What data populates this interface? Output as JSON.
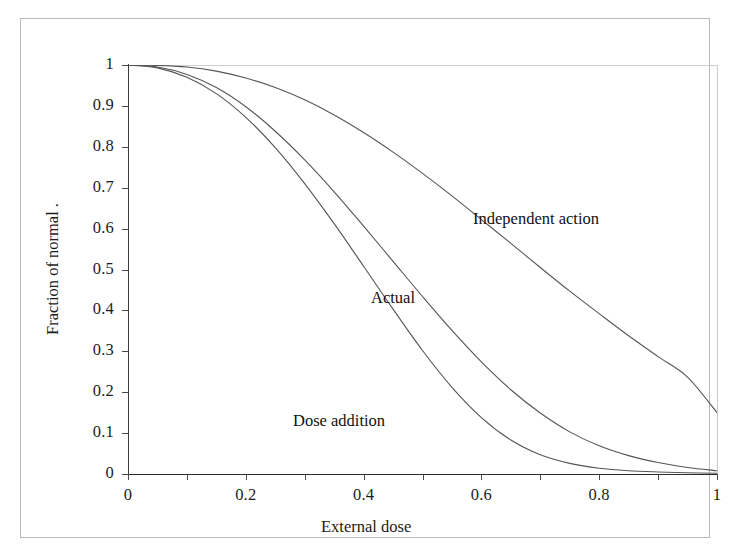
{
  "figure": {
    "frame_color": "#b9b9b9",
    "background": "#ffffff"
  },
  "chart_data": {
    "type": "line",
    "title": "",
    "subtitle": "",
    "xlabel": "External dose",
    "ylabel": "Fraction of normal .",
    "xlim": [
      0,
      1
    ],
    "ylim": [
      0,
      1
    ],
    "grid": false,
    "legend": "inline-annotations",
    "xticks": [
      0,
      0.2,
      0.4,
      0.6,
      0.8,
      1
    ],
    "xtick_labels": [
      "0",
      "0.2",
      "0.4",
      "0.6",
      "0.8",
      "1"
    ],
    "xminor_ticks": [
      0.1,
      0.3,
      0.5,
      0.7,
      0.9
    ],
    "yticks": [
      0,
      0.1,
      0.2,
      0.3,
      0.4,
      0.5,
      0.6,
      0.7,
      0.8,
      0.9,
      1
    ],
    "ytick_labels": [
      "0",
      "0.1",
      "0.2",
      "0.3",
      "0.4",
      "0.5",
      "0.6",
      "0.7",
      "0.8",
      "0.9",
      "1"
    ],
    "x": [
      0,
      0.05,
      0.1,
      0.15,
      0.2,
      0.25,
      0.3,
      0.35,
      0.4,
      0.45,
      0.5,
      0.55,
      0.6,
      0.65,
      0.7,
      0.75,
      0.8,
      0.85,
      0.9,
      0.95,
      1
    ],
    "series": [
      {
        "name": "Independent action",
        "label": "Independent action",
        "color": "#555555",
        "values": [
          1.0,
          0.999,
          0.995,
          0.985,
          0.968,
          0.945,
          0.915,
          0.878,
          0.835,
          0.787,
          0.735,
          0.68,
          0.622,
          0.564,
          0.505,
          0.447,
          0.392,
          0.338,
          0.287,
          0.237,
          0.15
        ]
      },
      {
        "name": "Actual",
        "label": "Actual",
        "color": "#555555",
        "values": [
          1.0,
          0.995,
          0.977,
          0.945,
          0.898,
          0.838,
          0.768,
          0.69,
          0.606,
          0.52,
          0.434,
          0.351,
          0.274,
          0.206,
          0.149,
          0.103,
          0.069,
          0.045,
          0.028,
          0.016,
          0.008
        ]
      },
      {
        "name": "Dose addition",
        "label": "Dose addition",
        "color": "#555555",
        "values": [
          1.0,
          0.993,
          0.97,
          0.93,
          0.872,
          0.798,
          0.71,
          0.612,
          0.508,
          0.403,
          0.302,
          0.212,
          0.138,
          0.083,
          0.047,
          0.026,
          0.014,
          0.008,
          0.005,
          0.003,
          0.002
        ]
      }
    ],
    "annotations": [
      {
        "text": "Independent action",
        "x": 0.59,
        "y": 0.66
      },
      {
        "text": "Actual",
        "x": 0.41,
        "y": 0.46
      },
      {
        "text": "Dose addition",
        "x": 0.28,
        "y": 0.155
      }
    ]
  }
}
